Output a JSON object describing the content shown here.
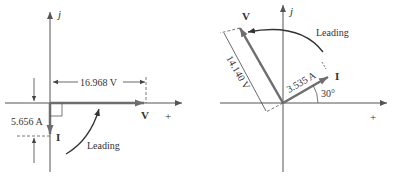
{
  "left_diagram": {
    "axis_imag_label": "j",
    "axis_real_label": "+",
    "voltage_label": "V",
    "current_label": "I",
    "voltage_magnitude": "16.968 V",
    "current_magnitude": "5.656 A",
    "annotation": "Leading",
    "voltage_angle_deg": 0,
    "current_angle_deg": -90
  },
  "right_diagram": {
    "axis_imag_label": "j",
    "axis_real_label": "+",
    "voltage_label": "V",
    "current_label": "I",
    "voltage_magnitude": "14.140 V",
    "current_magnitude": "3.535 A",
    "current_angle_label": "30°",
    "annotation": "Leading",
    "voltage_angle_deg": 120,
    "current_angle_deg": 30
  },
  "colors": {
    "axis": "#555555",
    "phasor": "#6e6e6e",
    "text": "#333333"
  }
}
